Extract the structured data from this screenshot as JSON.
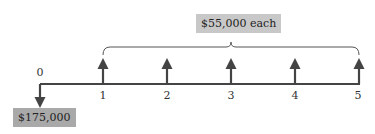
{
  "diagram": {
    "type": "cash-flow-timeline",
    "colors": {
      "line": "#444444",
      "top_box": "#c8c8c8",
      "bottom_box": "#a9a9a9"
    },
    "periods": [
      {
        "label": "0",
        "x": 40
      },
      {
        "label": "1",
        "x": 103
      },
      {
        "label": "2",
        "x": 167
      },
      {
        "label": "3",
        "x": 231
      },
      {
        "label": "4",
        "x": 295
      },
      {
        "label": "5",
        "x": 358
      }
    ],
    "outflow": {
      "period": "0",
      "amount": "$175,000",
      "direction": "down"
    },
    "inflows": {
      "periods": [
        "1",
        "2",
        "3",
        "4",
        "5"
      ],
      "amount_label": "$55,000 each",
      "direction": "up"
    }
  }
}
